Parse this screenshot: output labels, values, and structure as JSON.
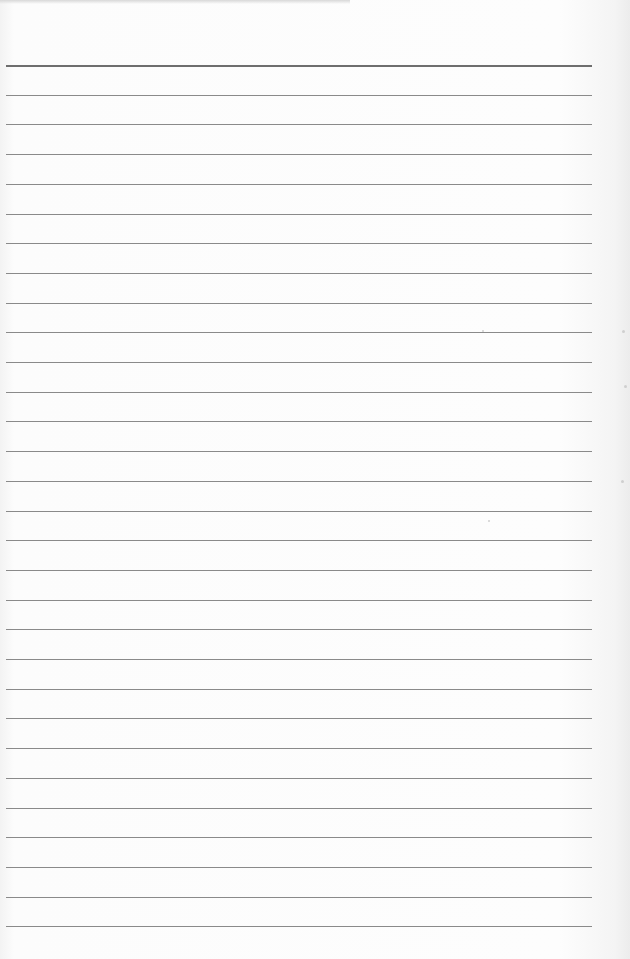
{
  "document": {
    "type": "blank lined paper",
    "line_count": 30,
    "first_line_y": 65,
    "line_spacing": 29.7,
    "line_color": "#8a8a8a",
    "header_line_color": "#6e6e6e",
    "paper_color": "#fbfbfb"
  }
}
